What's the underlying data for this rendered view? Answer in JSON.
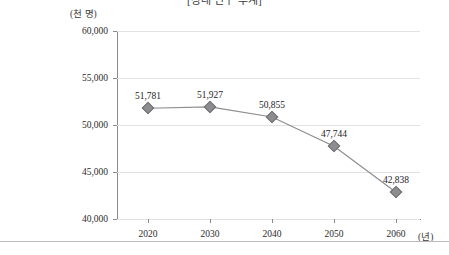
{
  "chart_data": {
    "type": "line",
    "title": "[장래 인구 추계]",
    "xlabel": "(년)",
    "ylabel": "(천 명)",
    "categories": [
      "2020",
      "2030",
      "2040",
      "2050",
      "2060"
    ],
    "values": [
      51781,
      51927,
      50855,
      47744,
      42838
    ],
    "point_labels": [
      "51,781",
      "51,927",
      "50,855",
      "47,744",
      "42,838"
    ],
    "ylim": [
      40000,
      60000
    ],
    "yticks": [
      60000,
      55000,
      50000,
      45000,
      40000
    ],
    "ytick_labels": [
      "60,000",
      "55,000",
      "50,000",
      "45,000",
      "40,000"
    ],
    "grid": true,
    "legend": "none",
    "series_color": "#8d8d90",
    "grid_color": "#e2e2e2",
    "axis_color": "#8a8a8a",
    "marker": "diamond"
  }
}
